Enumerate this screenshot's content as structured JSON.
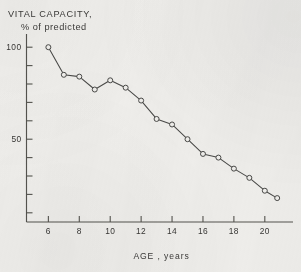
{
  "chart_data": {
    "type": "line",
    "title": "VITAL CAPACITY, % of predicted",
    "title_lines": [
      "VITAL CAPACITY,",
      "% of predicted"
    ],
    "xlabel": "AGE , years",
    "ylabel": "VITAL CAPACITY, % of predicted",
    "xlim": [
      5.2,
      21.5
    ],
    "ylim": [
      5,
      105
    ],
    "xticks": [
      6,
      8,
      10,
      12,
      14,
      16,
      18,
      20
    ],
    "xtick_labels": [
      "6",
      "8",
      "10",
      "12",
      "14",
      "16",
      "18",
      "20"
    ],
    "yticks": [
      10,
      20,
      30,
      40,
      50,
      60,
      70,
      80,
      90,
      100
    ],
    "ytick_labels": [
      "",
      "",
      "",
      "",
      "50",
      "",
      "",
      "",
      "",
      "100"
    ],
    "ylabels_shown": [
      "100",
      "50"
    ],
    "grid": false,
    "legend": null,
    "marker": "open-circle",
    "line_color": "#4a4a48",
    "marker_color": "#4a4a48",
    "background_color": "#f2f1ee",
    "series": [
      {
        "name": "Vital capacity",
        "x": [
          6.0,
          7.0,
          8.0,
          9.0,
          10.0,
          11.0,
          12.0,
          13.0,
          14.0,
          15.0,
          16.0,
          17.0,
          18.0,
          19.0,
          20.0,
          20.8
        ],
        "values": [
          100,
          85,
          84,
          77,
          82,
          78,
          71,
          61,
          58,
          50,
          42,
          40,
          34,
          29,
          22,
          18
        ]
      }
    ],
    "annotations": []
  }
}
